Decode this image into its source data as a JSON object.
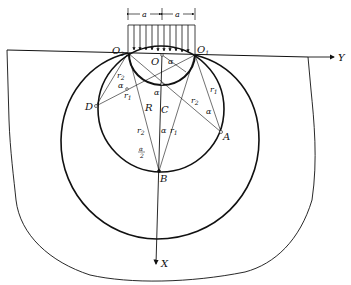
{
  "figure": {
    "load": {
      "dimension_left": "a",
      "dimension_right": "a"
    },
    "points": {
      "O2": "O",
      "O2_sub": "2",
      "O1": "O",
      "O1_sub": "1",
      "O": "O",
      "A": "A",
      "B": "B",
      "C": "C",
      "D": "D",
      "R": "R"
    },
    "axes": {
      "y": "Y",
      "x": "X"
    },
    "angles": {
      "alpha": "α",
      "half_alpha_num": "α",
      "half_alpha_den": "2"
    },
    "radii": {
      "r": "r",
      "sub1": "1",
      "sub2": "2"
    },
    "colors": {
      "ink": "#111111",
      "background": "#ffffff"
    }
  }
}
